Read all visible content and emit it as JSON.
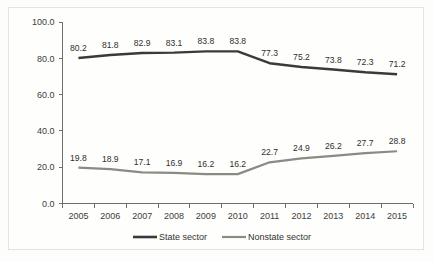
{
  "chart_data": {
    "type": "line",
    "title": "",
    "subtitle": "",
    "xlabel": "",
    "ylabel": "",
    "categories": [
      "2005",
      "2006",
      "2007",
      "2008",
      "2009",
      "2010",
      "2011",
      "2012",
      "2013",
      "2014",
      "2015"
    ],
    "series": [
      {
        "name": "State sector",
        "color": "#3a3a38",
        "values": [
          80.2,
          81.8,
          82.9,
          83.1,
          83.8,
          83.8,
          77.3,
          75.2,
          73.8,
          72.3,
          71.2
        ],
        "labels": [
          "80.2",
          "81.8",
          "82.9",
          "83.1",
          "83.8",
          "83.8",
          "77.3",
          "75.2",
          "73.8",
          "72.3",
          "71.2"
        ]
      },
      {
        "name": "Nonstate sector",
        "color": "#8b8b83",
        "values": [
          19.8,
          18.9,
          17.1,
          16.9,
          16.2,
          16.2,
          22.7,
          24.9,
          26.2,
          27.7,
          28.8
        ],
        "labels": [
          "19.8",
          "18.9",
          "17.1",
          "16.9",
          "16.2",
          "16.2",
          "22.7",
          "24.9",
          "26.2",
          "27.7",
          "28.8"
        ]
      }
    ],
    "ylim": [
      0.0,
      100.0
    ],
    "ytick_labels": [
      "0.0",
      "20.0",
      "40.0",
      "60.0",
      "80.0",
      "100.0"
    ],
    "ytick_values": [
      0.0,
      20.0,
      40.0,
      60.0,
      80.0,
      100.0
    ],
    "grid": false,
    "legend_position": "bottom-center",
    "legend_entries": [
      "State sector",
      "Nonstate sector"
    ]
  },
  "legend": {
    "items": [
      {
        "label": "State sector",
        "color": "#3a3a38"
      },
      {
        "label": "Nonstate sector",
        "color": "#8b8b83"
      }
    ]
  }
}
